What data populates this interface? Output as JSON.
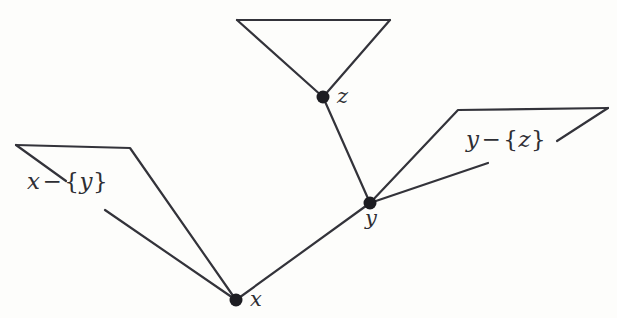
{
  "figure": {
    "ink_color": "#33333a",
    "paper_color": "#fdfdfb"
  },
  "vertices": [
    {
      "id": "x",
      "label": "x",
      "cx": 236,
      "cy": 300,
      "label_x": 250,
      "label_y": 289
    },
    {
      "id": "y",
      "label": "y",
      "cx": 370,
      "cy": 203,
      "label_x": 365,
      "label_y": 208
    },
    {
      "id": "z",
      "label": "z",
      "cx": 323,
      "cy": 97,
      "label_x": 337,
      "label_y": 86
    }
  ],
  "annotations": [
    {
      "id": "x-minus-y",
      "text": "x − {y}",
      "lhs": "x",
      "operator": "−",
      "open_brace": "{",
      "rhs": "y",
      "close_brace": "}",
      "label_x": 27,
      "label_y": 170
    },
    {
      "id": "y-minus-z",
      "text": "y − {z}",
      "lhs": "y",
      "operator": "−",
      "open_brace": "{",
      "rhs": "z",
      "close_brace": "}",
      "label_x": 466,
      "label_y": 128
    }
  ],
  "edges": [
    {
      "id": "edge-x-y",
      "from": "x",
      "to": "y",
      "points": "236,300 370,203"
    },
    {
      "id": "edge-z-y",
      "from": "z",
      "to": "y",
      "points": "323,97 370,203"
    }
  ],
  "brackets": [
    {
      "id": "bracket-x-minus-y",
      "describes": "x-minus-y",
      "points": "16,145 130,148 236,300"
    },
    {
      "id": "bracket-y-minus-z",
      "describes": "y-minus-z",
      "points": "370,203 458,110 608,108"
    },
    {
      "id": "bracket-subtree-z",
      "describes": "z",
      "points": "237,20 323,97 390,20"
    },
    {
      "id": "bracket-subtree-z-top",
      "describes": "z",
      "points": "237,20 390,20"
    }
  ],
  "leaders": [
    {
      "id": "leader-x-minus-y-top",
      "points": "16,145 66,181"
    },
    {
      "id": "leader-x-minus-y-bottom",
      "points": "105,210 236,300"
    },
    {
      "id": "leader-y-minus-z-top",
      "points": "608,108 557,141"
    },
    {
      "id": "leader-y-minus-z-bottom",
      "points": "488,163 370,203"
    }
  ]
}
